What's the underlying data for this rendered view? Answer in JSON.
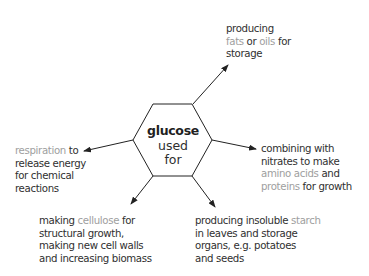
{
  "center": {
    "title": "glucose",
    "line2": "used",
    "line3": "for"
  },
  "colors": {
    "text": "#2f2f2f",
    "highlight": "#9e9e9e",
    "lines": "#222222"
  },
  "nodes": {
    "fats": {
      "l1": "producing",
      "l2a": "fats",
      "l2b": " or ",
      "l2c": "oils",
      "l2d": " for",
      "l3": "storage"
    },
    "respiration": {
      "l1a": "respiration",
      "l1b": " to",
      "l2": "release energy",
      "l3": "for chemical",
      "l4": "reactions"
    },
    "amino": {
      "l1": "combining with",
      "l2": "nitrates to make",
      "l3a": "amino acids",
      "l3b": " and",
      "l4a": "proteins",
      "l4b": " for growth"
    },
    "cellulose": {
      "l1a": "making ",
      "l1b": "cellulose",
      "l1c": " for",
      "l2": "structural growth,",
      "l3": "making new cell walls",
      "l4": "and increasing biomass"
    },
    "starch": {
      "l1a": "producing insoluble ",
      "l1b": "starch",
      "l2": "in leaves and storage",
      "l3": "organs, e.g. potatoes",
      "l4": "and seeds"
    }
  }
}
